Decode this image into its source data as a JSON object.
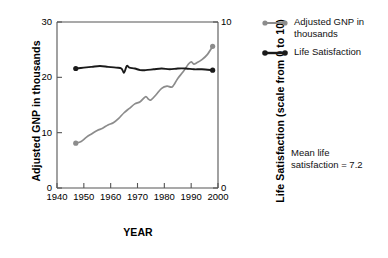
{
  "chart_data": {
    "type": "line",
    "title": "",
    "xlabel": "YEAR",
    "ylabel": "Adjusted GNP in thousands",
    "y2label": "Life Satisfaction (scale from 0 to 10)",
    "xlim": [
      1940,
      2000
    ],
    "ylim": [
      0,
      30
    ],
    "y2lim": [
      0,
      10
    ],
    "xticks": [
      1940,
      1950,
      1960,
      1970,
      1980,
      1990,
      2000
    ],
    "xtick_labels": [
      "1940",
      "1950",
      "1960",
      "1970",
      "1980",
      "1990",
      "2000"
    ],
    "yticks": [
      0,
      10,
      20,
      30
    ],
    "ytick_labels": [
      "0",
      "10",
      "20",
      "30"
    ],
    "y2ticks": [
      0,
      10
    ],
    "y2tick_labels": [
      "0",
      "10"
    ],
    "grid": false,
    "legend_position": "top-right",
    "annotations": [
      {
        "name": "mean-life-satisfaction-note",
        "line1": "Mean life",
        "line2": "satisfaction = 7.2"
      }
    ],
    "series": [
      {
        "name": "Adjusted GNP in thousands",
        "color": "#8c8c8c",
        "axis": "left",
        "marker_endpoints": true,
        "x": [
          1947,
          1949,
          1951,
          1953,
          1955,
          1957,
          1959,
          1961,
          1963,
          1965,
          1967,
          1969,
          1971,
          1973,
          1974,
          1975,
          1977,
          1979,
          1981,
          1983,
          1985,
          1987,
          1989,
          1990,
          1991,
          1992,
          1994,
          1996,
          1998
        ],
        "values": [
          8.1,
          8.4,
          9.2,
          9.8,
          10.4,
          10.8,
          11.4,
          11.8,
          12.6,
          13.6,
          14.4,
          15.2,
          15.6,
          16.5,
          16.1,
          15.9,
          16.9,
          18.0,
          18.4,
          18.3,
          19.8,
          21.0,
          22.4,
          22.8,
          22.4,
          22.6,
          23.2,
          24.1,
          25.6
        ]
      },
      {
        "name": "Life Satisfaction",
        "color": "#1a1a1a",
        "axis": "right",
        "marker_endpoints": true,
        "x": [
          1947,
          1950,
          1953,
          1956,
          1959,
          1962,
          1964,
          1965,
          1966,
          1967,
          1969,
          1971,
          1973,
          1976,
          1979,
          1982,
          1985,
          1988,
          1991,
          1994,
          1998
        ],
        "values": [
          7.2,
          7.25,
          7.3,
          7.35,
          7.3,
          7.25,
          7.2,
          6.95,
          7.35,
          7.25,
          7.2,
          7.1,
          7.1,
          7.15,
          7.2,
          7.15,
          7.2,
          7.2,
          7.15,
          7.15,
          7.1
        ]
      }
    ],
    "mean_life_satisfaction": 7.2
  },
  "legend": {
    "items": [
      {
        "label_line1": "Adjusted GNP in",
        "label_line2": "thousands",
        "color": "#8c8c8c"
      },
      {
        "label_line1": "Life Satisfaction",
        "label_line2": "",
        "color": "#1a1a1a"
      }
    ]
  }
}
